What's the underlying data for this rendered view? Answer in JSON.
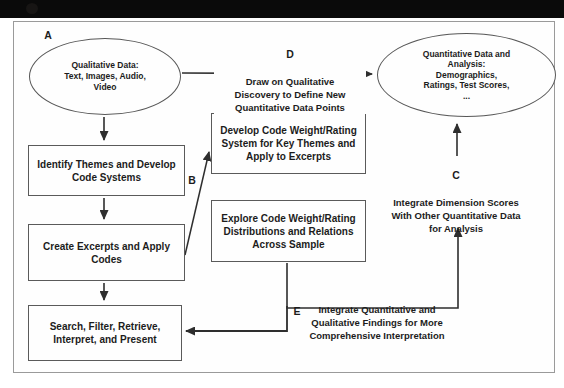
{
  "figure": {
    "nodes": {
      "qualitative": {
        "label": "A",
        "text": "Qualitative Data:\nText, Images, Audio,\nVideo"
      },
      "quantitative": {
        "text": "Quantitative Data and\nAnalysis:\nDemographics,\nRatings, Test Scores,\n..."
      },
      "identify_themes": {
        "text": "Identify Themes and Develop\nCode Systems"
      },
      "create_excerpts": {
        "text": "Create Excerpts and Apply\nCodes"
      },
      "search_filter": {
        "text": "Search, Filter, Retrieve,\nInterpret, and Present"
      },
      "develop_weight": {
        "text": "Develop Code Weight/Rating\nSystem for Key Themes and\nApply to Excerpts"
      },
      "explore_weight": {
        "text": "Explore Code Weight/Rating\nDistributions and Relations\nAcross Sample"
      }
    },
    "paths": {
      "b": {
        "label": "B"
      },
      "c": {
        "label": "C",
        "text": "Integrate Dimension Scores\nWith Other Quantitative Data\nfor Analysis"
      },
      "d": {
        "label": "D",
        "text": "Draw on Qualitative\nDiscovery to Define New\nQuantitative Data Points"
      },
      "e": {
        "label": "E",
        "text": "Integrate Quantitative and\nQualitative Findings for More\nComprehensive Interpretation"
      }
    },
    "colors": {
      "ink": "#1c1c1c",
      "line": "#2e2e2e",
      "frame": "#9a9a9a",
      "header_bar": "#0a0a0a"
    }
  }
}
